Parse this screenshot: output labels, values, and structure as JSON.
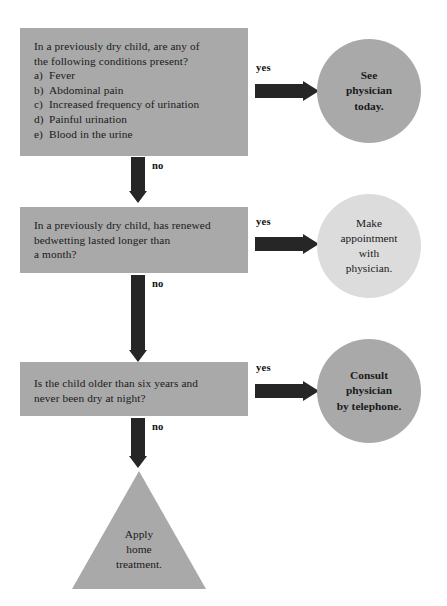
{
  "diagram": {
    "colors": {
      "box_gray": "#a9a9a9",
      "circle_dark_gray": "#a9a9a9",
      "circle_light_gray": "#dcdcdc",
      "triangle_gray": "#a9a9a9",
      "arrow_black": "#262626",
      "background": "#ffffff",
      "text": "#1a1a1a"
    },
    "questions": [
      {
        "id": "q1",
        "lines": [
          "In a previously dry child, are any of",
          "the following conditions present?"
        ],
        "options": [
          {
            "label": "a)",
            "text": "Fever"
          },
          {
            "label": "b)",
            "text": "Abdominal pain"
          },
          {
            "label": "c)",
            "text": "Increased frequency of urination"
          },
          {
            "label": "d)",
            "text": "Painful urination"
          },
          {
            "label": "e)",
            "text": "Blood in the urine"
          }
        ]
      },
      {
        "id": "q2",
        "lines": [
          "In a previously dry child, has renewed",
          "bedwetting lasted longer than",
          "a month?"
        ],
        "options": []
      },
      {
        "id": "q3",
        "lines": [
          "Is the child older than six years and",
          "never been dry at night?"
        ],
        "options": []
      }
    ],
    "outcomes": [
      {
        "id": "o1",
        "lines": [
          "See",
          "physician",
          "today."
        ],
        "shade": "dark",
        "bold": true
      },
      {
        "id": "o2",
        "lines": [
          "Make",
          "appointment",
          "with",
          "physician."
        ],
        "shade": "light",
        "bold": false
      },
      {
        "id": "o3",
        "lines": [
          "Consult",
          "physician",
          "by telephone."
        ],
        "shade": "dark",
        "bold": true
      }
    ],
    "terminal": {
      "id": "t1",
      "lines": [
        "Apply",
        "home",
        "treatment."
      ]
    },
    "edges": {
      "yes": "yes",
      "no": "no"
    }
  }
}
